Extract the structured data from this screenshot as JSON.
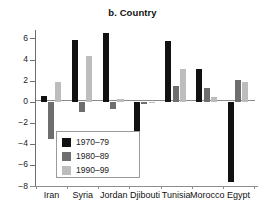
{
  "chart_data": {
    "type": "bar",
    "title": "b. Country",
    "xlabel": "",
    "ylabel": "",
    "ylim": [
      -8,
      6.8
    ],
    "yticks": [
      6,
      4,
      2,
      0,
      -2,
      -4,
      -6,
      -8
    ],
    "ytick_labels": [
      "6",
      "4",
      "2",
      "0",
      "−2",
      "−4",
      "−6",
      "−8"
    ],
    "grid": false,
    "legend_position": "inside-lower-left",
    "categories": [
      "Iran",
      "Syria",
      "Jordan",
      "Djibouti",
      "Tunisia",
      "Morocco",
      "Egypt"
    ],
    "series": [
      {
        "name": "1970–79",
        "color": "#111111",
        "values": [
          0.5,
          5.85,
          6.5,
          -4.6,
          5.8,
          3.1,
          -7.6
        ]
      },
      {
        "name": "1980–89",
        "color": "#6e6e6e",
        "values": [
          -3.5,
          -1.0,
          -0.7,
          -0.25,
          1.5,
          1.3,
          2.1
        ]
      },
      {
        "name": "1990–99",
        "color": "#bdbdbd",
        "values": [
          1.9,
          4.35,
          0.25,
          -0.15,
          3.1,
          0.4,
          1.85
        ]
      }
    ]
  },
  "colors": {
    "axis": "#8a8a8a",
    "text": "#111111",
    "background": "#ffffff"
  }
}
